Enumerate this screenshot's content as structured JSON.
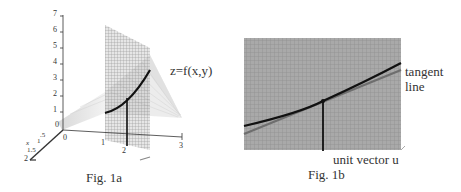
{
  "figures": [
    {
      "id": "fig1a",
      "caption": "Fig. 1a",
      "surface_label": "z=f(x,y)",
      "z_axis_ticks": [
        "7",
        "6",
        "5",
        "4",
        "3",
        "2",
        "1",
        "0"
      ],
      "x_axis_ticks": [
        "0",
        "1",
        "2",
        "3"
      ],
      "y_axis_ticks": [
        "0",
        ".5",
        "1",
        "1.5",
        "2"
      ],
      "y_axis_label": "x",
      "x_axis_label": "y"
    },
    {
      "id": "fig1b",
      "caption": "Fig. 1b",
      "tangent_label_line1": "tangent",
      "tangent_label_line2": "line",
      "vector_label": "unit vector u"
    }
  ],
  "colors": {
    "grid_plane": "#9a9a9a",
    "curve": "#1a1a1a",
    "tangent": "#6e6e6e",
    "surface": "#d9d9d9"
  }
}
